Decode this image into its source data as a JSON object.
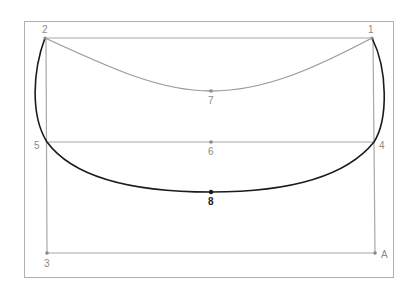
{
  "diagram": {
    "frame": {
      "x": 24,
      "y": 21,
      "width": 369,
      "height": 256,
      "color": "#b0b0b0"
    },
    "colors": {
      "grid_line": "#a8a8a8",
      "thin_curve": "#9a9a9a",
      "thick_curve": "#1a1a1a",
      "label": "#8a8a8a",
      "bold_label": "#222222"
    },
    "points": [
      {
        "id": "1",
        "label": "1",
        "x": 372,
        "y": 38
      },
      {
        "id": "2",
        "label": "2",
        "x": 45,
        "y": 38
      },
      {
        "id": "3",
        "label": "3",
        "x": 47,
        "y": 253
      },
      {
        "id": "4",
        "label": "4",
        "x": 374,
        "y": 142
      },
      {
        "id": "5",
        "label": "5",
        "x": 47,
        "y": 142
      },
      {
        "id": "6",
        "label": "6",
        "x": 211,
        "y": 142
      },
      {
        "id": "7",
        "label": "7",
        "x": 211,
        "y": 91
      },
      {
        "id": "8",
        "label": "8",
        "x": 211,
        "y": 192
      },
      {
        "id": "A",
        "label": "A",
        "x": 375,
        "y": 253
      }
    ],
    "labels": {
      "p1": "1",
      "p2": "2",
      "p3": "3",
      "p4": "4",
      "p5": "5",
      "p6": "6",
      "p7": "7",
      "p8": "8",
      "pA": "A"
    },
    "segments": [
      {
        "from": "2",
        "to": "1",
        "style": "thin"
      },
      {
        "from": "5",
        "to": "4",
        "style": "thin"
      },
      {
        "from": "2",
        "to": "3",
        "style": "thin"
      },
      {
        "from": "3",
        "to": "A",
        "style": "thin"
      },
      {
        "from": "1",
        "to": "A",
        "style": "thin"
      }
    ],
    "curves": [
      {
        "name": "upper-arc",
        "through": [
          "2",
          "7",
          "1"
        ],
        "style": "thin"
      },
      {
        "name": "lower-loop",
        "through": [
          "2",
          "5",
          "8",
          "4",
          "1"
        ],
        "style": "thick"
      }
    ]
  }
}
